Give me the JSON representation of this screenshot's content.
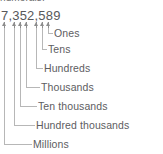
{
  "heading": {
    "clipped_text": "numerals."
  },
  "numeral": {
    "value": "7,352,589",
    "digits": [
      "7",
      "3",
      "5",
      "2",
      "5",
      "8",
      "9"
    ]
  },
  "colors": {
    "text": "#5d5d5f",
    "numeral_text": "#58585a",
    "arrow": "#8d8d8d",
    "leader_line": "#b7b7b7",
    "background": "#ffffff"
  },
  "chart_data": {
    "type": "diagram",
    "labels": [
      "Ones",
      "Tens",
      "Hundreds",
      "Thousands",
      "Ten thousands",
      "Hundred thousands",
      "Millions"
    ],
    "mapping": [
      {
        "digit": "9",
        "place": "Ones",
        "value": 9
      },
      {
        "digit": "8",
        "place": "Tens",
        "value": 80
      },
      {
        "digit": "5",
        "place": "Hundreds",
        "value": 500
      },
      {
        "digit": "2",
        "place": "Thousands",
        "value": 2000
      },
      {
        "digit": "5",
        "place": "Ten thousands",
        "value": 50000
      },
      {
        "digit": "3",
        "place": "Hundred thousands",
        "value": 300000
      },
      {
        "digit": "7",
        "place": "Millions",
        "value": 7000000
      }
    ]
  },
  "places": [
    {
      "label": "Ones",
      "arrow_x": 48,
      "elbow_y": 33,
      "text_x": 54,
      "text_y": 28
    },
    {
      "label": "Tens",
      "arrow_x": 42,
      "elbow_y": 49,
      "text_x": 48,
      "text_y": 44
    },
    {
      "label": "Hundreds",
      "arrow_x": 36,
      "elbow_y": 68,
      "text_x": 44,
      "text_y": 63
    },
    {
      "label": "Thousands",
      "arrow_x": 26,
      "elbow_y": 87,
      "text_x": 41,
      "text_y": 82
    },
    {
      "label": "Ten thousands",
      "arrow_x": 20,
      "elbow_y": 106,
      "text_x": 38,
      "text_y": 101
    },
    {
      "label": "Hundred thousands",
      "arrow_x": 14,
      "elbow_y": 125,
      "text_x": 36,
      "text_y": 120
    },
    {
      "label": "Millions",
      "arrow_x": 4,
      "elbow_y": 144,
      "text_x": 33,
      "text_y": 139
    }
  ]
}
